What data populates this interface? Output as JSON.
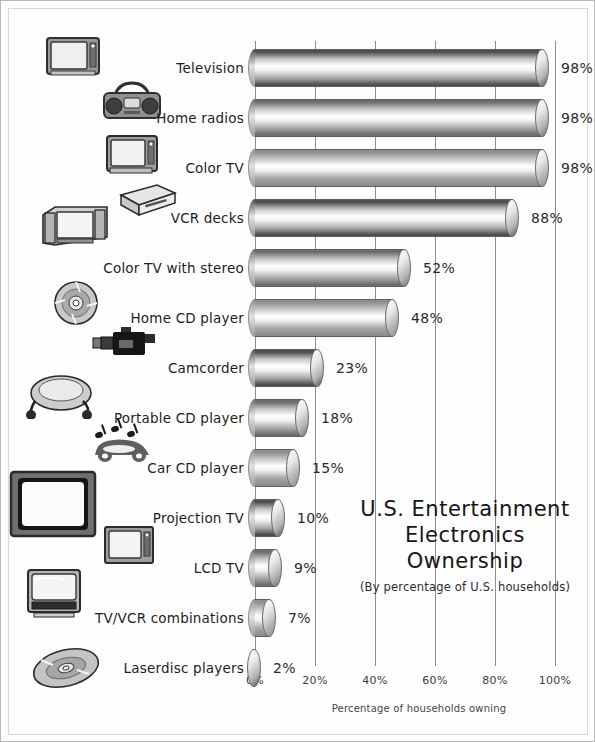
{
  "chart_data": {
    "type": "bar",
    "orientation": "horizontal",
    "title": "U.S. Entertainment Electronics Ownership",
    "title_lines": [
      "U.S. Entertainment",
      "Electronics",
      "Ownership"
    ],
    "subtitle": "(By percentage of U.S. households)",
    "xlabel": "Percentage of households owning",
    "ylabel": "",
    "xlim": [
      0,
      100
    ],
    "xticks": [
      0,
      20,
      40,
      60,
      80,
      100
    ],
    "xtick_labels": [
      "0%",
      "20%",
      "40%",
      "60%",
      "80%",
      "100%"
    ],
    "grid": true,
    "legend": false,
    "categories": [
      "Television",
      "Home radios",
      "Color TV",
      "VCR decks",
      "Color TV with stereo",
      "Home CD player",
      "Camcorder",
      "Portable CD player",
      "Car CD player",
      "Projection TV",
      "LCD TV",
      "TV/VCR combinations",
      "Laserdisc players"
    ],
    "values": [
      98,
      98,
      98,
      88,
      52,
      48,
      23,
      18,
      15,
      10,
      9,
      7,
      2
    ],
    "value_labels": [
      "98%",
      "98%",
      "98%",
      "88%",
      "52%",
      "48%",
      "23%",
      "18%",
      "15%",
      "10%",
      "9%",
      "7%",
      "2%"
    ],
    "bar_icons": [
      "television-icon",
      "boombox-radio-icon",
      "color-tv-icon",
      "vcr-deck-icon",
      "stereo-tv-icon",
      "compact-disc-icon",
      "camcorder-icon",
      "portable-cd-player-icon",
      "car-with-music-notes-icon",
      "projection-tv-icon",
      "lcd-tv-icon",
      "tv-vcr-combo-icon",
      "laserdisc-icon"
    ]
  },
  "colors": {
    "background": "#ffffff",
    "border": "#b9b9b9",
    "gridline": "#8d8d8d",
    "text": "#1d1d1d",
    "bar_dark": "#555555",
    "bar_light": "#ffffff"
  }
}
